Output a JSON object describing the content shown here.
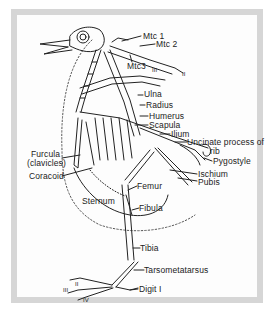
{
  "figure": {
    "frame_color": "#d6d6d6",
    "ink_color": "#222222"
  },
  "labels": {
    "mtc1": "Mtc 1",
    "mtc2": "Mtc 2",
    "mtc3": "Mtc3",
    "digit_iii_wing": "III",
    "digit_ii_wing": "II",
    "ulna": "Ulna",
    "radius": "Radius",
    "humerus": "Humerus",
    "scapula": "Scapula",
    "ilium": "Ilium",
    "uncinate": "Uncinate process of",
    "uncinate2": "rib",
    "pygostyle": "Pygostyle",
    "furcula": "Furcula",
    "furcula2": "(clavicles)",
    "coracoid": "Coracoid",
    "ischium": "Ischium",
    "pubis": "Pubis",
    "femur": "Femur",
    "sternum": "Sternum",
    "fibula": "Fibula",
    "tibia": "Tibia",
    "tarsometatarsus": "Tarsometatarsus",
    "digit1": "Digit I",
    "digit_iii_foot": "III",
    "digit_ii_foot": "II",
    "digit_iv_foot": "IV"
  }
}
